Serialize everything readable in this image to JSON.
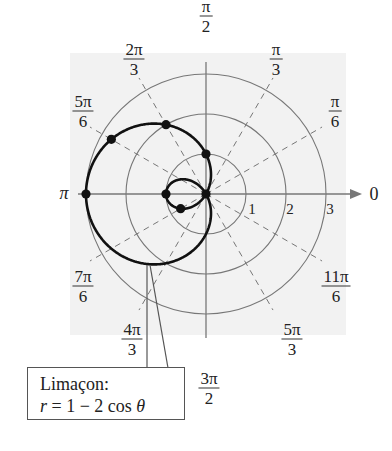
{
  "figure": {
    "type": "polar-graph",
    "background_color": "#f2f2f2",
    "grid_color": "#777777",
    "curve_color": "#111111",
    "axis": {
      "polar_axis_end_label": "0",
      "left_label": "π",
      "radial_ticks": [
        "1",
        "2",
        "3"
      ]
    },
    "angle_labels": [
      {
        "num": "π",
        "den": "2",
        "angle": "pi/2"
      },
      {
        "num": "π",
        "den": "3",
        "angle": "pi/3"
      },
      {
        "num": "π",
        "den": "6",
        "angle": "pi/6"
      },
      {
        "num": "2π",
        "den": "3",
        "angle": "2pi/3"
      },
      {
        "num": "5π",
        "den": "6",
        "angle": "5pi/6"
      },
      {
        "num": "7π",
        "den": "6",
        "angle": "7pi/6"
      },
      {
        "num": "4π",
        "den": "3",
        "angle": "4pi/3"
      },
      {
        "num": "3π",
        "den": "2",
        "angle": "3pi/2"
      },
      {
        "num": "5π",
        "den": "3",
        "angle": "5pi/3"
      },
      {
        "num": "11π",
        "den": "6",
        "angle": "11pi/6"
      }
    ],
    "callout": {
      "title": "Limaçon:",
      "equation_lhs": "r",
      "equation_rest": " = 1 − 2 cos ",
      "equation_var": "θ"
    }
  },
  "chart_data": {
    "type": "scatter",
    "title": "Limaçon: r = 1 − 2 cos θ",
    "coordinate_system": "polar",
    "equation": "r = 1 - 2cos(θ)",
    "radial_grid": [
      1,
      2,
      3
    ],
    "angular_grid_deg": [
      0,
      30,
      60,
      90,
      120,
      150,
      180,
      210,
      240,
      270,
      300,
      330
    ],
    "rlim": [
      0,
      3
    ],
    "marked_points": [
      {
        "theta": "0",
        "r": -1
      },
      {
        "theta": "π/6",
        "r": -0.73
      },
      {
        "theta": "π/3",
        "r": 0
      },
      {
        "theta": "π/2",
        "r": 1
      },
      {
        "theta": "2π/3",
        "r": 2
      },
      {
        "theta": "5π/6",
        "r": 2.73
      },
      {
        "theta": "π",
        "r": 3
      }
    ],
    "legend": "none",
    "xlabel": "",
    "ylabel": ""
  }
}
